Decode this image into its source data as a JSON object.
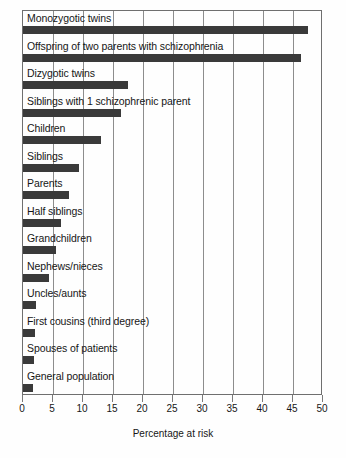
{
  "chart_data": {
    "type": "bar",
    "orientation": "horizontal",
    "title": "",
    "xlabel": "Percentage at risk",
    "ylabel": "",
    "xlim": [
      0,
      50
    ],
    "xticks": [
      0,
      5,
      10,
      15,
      20,
      25,
      30,
      35,
      40,
      45,
      50
    ],
    "xtick_labels": [
      "0",
      "5",
      "10",
      "15",
      "20",
      "25",
      "30",
      "35",
      "40",
      "45",
      "50"
    ],
    "grid": true,
    "legend": null,
    "bar_color": "#3a3a3a",
    "categories": [
      "Monozygotic twins",
      "Offspring of two parents with schizophrenia",
      "Dizygotic twins",
      "Siblings with 1 schizophrenic parent",
      "Children",
      "Siblings",
      "Parents",
      "Half siblings",
      "Grandchildren",
      "Nephews/nieces",
      "Uncles/aunts",
      "First cousins (third degree)",
      "Spouses of patients",
      "General population"
    ],
    "values": [
      47.5,
      46.3,
      17.5,
      16.3,
      13,
      9.3,
      7.7,
      6.3,
      5.5,
      4.3,
      2.2,
      2,
      1.8,
      1.7
    ]
  }
}
